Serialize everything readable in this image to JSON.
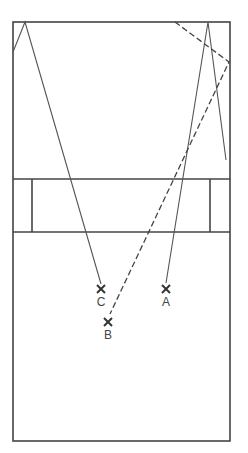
{
  "diagram": {
    "type": "volleyball-court-play-diagram",
    "colors": {
      "stroke": "#444444",
      "background": "#ffffff"
    },
    "court": {
      "x1": 13,
      "y1": 22,
      "x2": 230,
      "y2": 441
    },
    "net_zone": {
      "y_top": 179,
      "y_bottom": 232,
      "left_post_x": 32,
      "right_post_x": 210
    },
    "players": [
      {
        "id": "A",
        "label": "A",
        "x": 166,
        "y": 289
      },
      {
        "id": "B",
        "label": "B",
        "x": 108,
        "y": 322
      },
      {
        "id": "C",
        "label": "C",
        "x": 101,
        "y": 290
      }
    ],
    "paths": [
      {
        "style": "solid",
        "points": [
          [
            13,
            52
          ],
          [
            25,
            22
          ],
          [
            101,
            284
          ]
        ]
      },
      {
        "style": "solid",
        "points": [
          [
            166,
            283
          ],
          [
            208,
            22
          ],
          [
            226,
            160
          ]
        ]
      },
      {
        "style": "dashed",
        "points": [
          [
            175,
            22
          ],
          [
            229,
            62
          ],
          [
            110,
            314
          ]
        ]
      }
    ]
  }
}
